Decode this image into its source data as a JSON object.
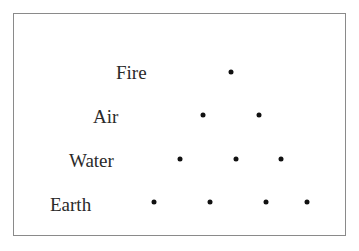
{
  "diagram": {
    "type": "tetractys",
    "rows": [
      {
        "label": "Fire",
        "label_pos": {
          "x": 116,
          "y": 63
        },
        "count": 1,
        "dots": [
          {
            "x": 231,
            "y": 72
          }
        ]
      },
      {
        "label": "Air",
        "label_pos": {
          "x": 93,
          "y": 107
        },
        "count": 2,
        "dots": [
          {
            "x": 203,
            "y": 115
          },
          {
            "x": 259,
            "y": 115
          }
        ]
      },
      {
        "label": "Water",
        "label_pos": {
          "x": 69,
          "y": 151
        },
        "count": 3,
        "dots": [
          {
            "x": 180,
            "y": 159
          },
          {
            "x": 236,
            "y": 159
          },
          {
            "x": 281,
            "y": 159
          }
        ]
      },
      {
        "label": "Earth",
        "label_pos": {
          "x": 50,
          "y": 195
        },
        "count": 4,
        "dots": [
          {
            "x": 154,
            "y": 202
          },
          {
            "x": 210,
            "y": 202
          },
          {
            "x": 266,
            "y": 202
          },
          {
            "x": 307,
            "y": 202
          }
        ]
      }
    ]
  },
  "colors": {
    "border": "#8a8a8a",
    "text": "#2a2a2a",
    "dot": "#111111",
    "background": "#ffffff"
  }
}
